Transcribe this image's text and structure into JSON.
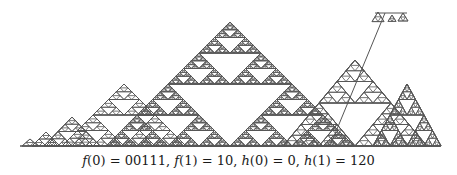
{
  "figure": {
    "baseline": {
      "x1": 20,
      "x2": 440,
      "y": 146
    },
    "stroke_color": "#555555",
    "triangles": [
      {
        "cx": 30,
        "peak_y": 139,
        "half_width": 8,
        "depth": 1
      },
      {
        "cx": 46,
        "peak_y": 132,
        "half_width": 14,
        "depth": 2
      },
      {
        "cx": 72,
        "peak_y": 117,
        "half_width": 28,
        "depth": 3
      },
      {
        "cx": 124,
        "peak_y": 84,
        "half_width": 62,
        "depth": 4
      },
      {
        "cx": 230,
        "peak_y": 22,
        "half_width": 124,
        "depth": 6
      },
      {
        "cx": 355,
        "peak_y": 60,
        "half_width": 72,
        "depth": 4
      },
      {
        "cx": 407,
        "peak_y": 84,
        "half_width": 34,
        "depth": 4
      }
    ],
    "extra_segments": [
      {
        "type": "stem",
        "points": [
          [
            330,
            146
          ],
          [
            385,
            13
          ]
        ]
      },
      {
        "type": "flat-top",
        "points": [
          [
            375,
            13
          ],
          [
            407,
            13
          ]
        ]
      }
    ],
    "top_cluster": [
      {
        "cx": 378,
        "peak_y": 12,
        "half_width": 6,
        "depth": 1
      },
      {
        "cx": 392,
        "peak_y": 15,
        "half_width": 4,
        "depth": 1
      },
      {
        "cx": 403,
        "peak_y": 13,
        "half_width": 5,
        "depth": 1
      }
    ]
  },
  "caption": {
    "parts": [
      {
        "text": "f",
        "italic": true
      },
      {
        "text": "(0) = 00111, ",
        "italic": false
      },
      {
        "text": "f",
        "italic": true
      },
      {
        "text": "(1) = 10, ",
        "italic": false
      },
      {
        "text": "h",
        "italic": true
      },
      {
        "text": "(0) = 0, ",
        "italic": false
      },
      {
        "text": "h",
        "italic": true
      },
      {
        "text": "(1) = 120",
        "italic": false
      }
    ],
    "full_text": "f(0) = 00111, f(1) = 10, h(0) = 0, h(1) = 120"
  }
}
